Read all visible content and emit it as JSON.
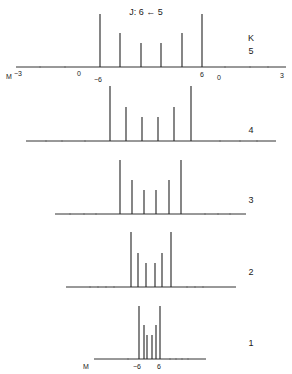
{
  "title": "J: 6 ← 5",
  "k_header": "K",
  "axis_letter": "M",
  "panel5_labels": {
    "left_minus3": "−3",
    "left_zero": "0",
    "minus6": "−6",
    "six": "6",
    "right_zero": "0",
    "right_three": "3"
  },
  "panel1_labels": {
    "minus6": "−6",
    "six": "6"
  },
  "chart_data": {
    "type": "bar",
    "title": "J: 6 ← 5",
    "xlabel": "M",
    "ylabel": "",
    "legend": "K",
    "grid": false,
    "series": [
      {
        "K": 5,
        "line_x_px": [
          100,
          120,
          141,
          161,
          182,
          202
        ],
        "relative_intensity": [
          1.0,
          0.64,
          0.45,
          0.45,
          0.64,
          1.0
        ],
        "axis_px": [
          16,
          286
        ],
        "baseline_px": 67
      },
      {
        "K": 4,
        "line_x_px": [
          110,
          126,
          142,
          158,
          174,
          191
        ],
        "relative_intensity": [
          1.0,
          0.62,
          0.44,
          0.44,
          0.62,
          1.0
        ],
        "axis_px": [
          26,
          276
        ],
        "baseline_px": 141
      },
      {
        "K": 3,
        "line_x_px": [
          120,
          132,
          144,
          156,
          169,
          181
        ],
        "relative_intensity": [
          1.0,
          0.63,
          0.44,
          0.44,
          0.63,
          1.0
        ],
        "axis_px": [
          55,
          246
        ],
        "baseline_px": 214
      },
      {
        "K": 2,
        "line_x_px": [
          131,
          138,
          146,
          155,
          162,
          171
        ],
        "relative_intensity": [
          1.0,
          0.62,
          0.44,
          0.44,
          0.62,
          1.0
        ],
        "axis_px": [
          66,
          236
        ],
        "baseline_px": 287
      },
      {
        "K": 1,
        "line_x_px": [
          139,
          144,
          147,
          152,
          156,
          160
        ],
        "relative_intensity": [
          1.0,
          0.64,
          0.45,
          0.45,
          0.64,
          1.0
        ],
        "axis_px": [
          94,
          206
        ],
        "baseline_px": 359
      }
    ],
    "tick_labels_panel5": [
      "-3",
      "0",
      "-6",
      "6",
      "0",
      "3"
    ],
    "tick_labels_panel1": [
      "-6",
      "6"
    ]
  },
  "panels": [
    {
      "k": "5",
      "baseline": 67,
      "x0": 16,
      "x1": 286,
      "tall": 53,
      "lines": [
        100,
        120,
        141,
        161,
        182,
        202
      ],
      "heights": [
        53,
        34,
        24,
        24,
        34,
        53
      ],
      "minor_ticks": [
        40,
        65,
        225,
        250,
        268
      ],
      "k_label_y": 51
    },
    {
      "k": "4",
      "baseline": 141,
      "x0": 26,
      "x1": 276,
      "tall": 55,
      "lines": [
        110,
        126,
        142,
        158,
        174,
        191
      ],
      "heights": [
        55,
        34,
        24,
        24,
        34,
        55
      ],
      "minor_ticks": [
        46,
        62,
        85,
        220,
        240,
        257
      ],
      "k_label_y": 130
    },
    {
      "k": "3",
      "baseline": 214,
      "x0": 55,
      "x1": 246,
      "tall": 54,
      "lines": [
        120,
        132,
        144,
        156,
        169,
        181
      ],
      "heights": [
        54,
        34,
        24,
        24,
        34,
        54
      ],
      "minor_ticks": [
        70,
        84,
        96,
        205,
        218,
        230
      ],
      "k_label_y": 200
    },
    {
      "k": "2",
      "baseline": 287,
      "x0": 66,
      "x1": 236,
      "tall": 55,
      "lines": [
        131,
        138,
        146,
        155,
        162,
        171
      ],
      "heights": [
        55,
        34,
        24,
        24,
        34,
        55
      ],
      "minor_ticks": [
        90,
        98,
        106,
        114,
        187,
        195,
        203
      ],
      "k_label_y": 272
    },
    {
      "k": "1",
      "baseline": 359,
      "x0": 94,
      "x1": 206,
      "tall": 53,
      "lines": [
        139,
        144,
        147,
        152,
        156,
        160
      ],
      "heights": [
        53,
        34,
        24,
        24,
        34,
        53
      ],
      "minor_ticks": [
        128,
        170,
        176,
        182,
        188
      ],
      "k_label_y": 343
    }
  ]
}
